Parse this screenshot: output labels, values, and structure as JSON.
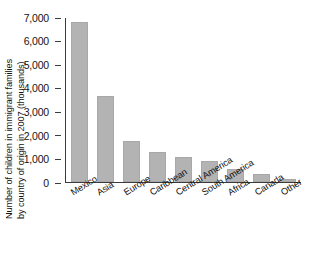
{
  "chart_data": {
    "type": "bar",
    "title": "",
    "subtitle": "",
    "xlabel": "",
    "ylabel": "Number of children in immigrant families by country of origin in 2007 (thousands)",
    "ylabel_lines": [
      "Number of children in immigrant families",
      "by country of origin in 2007 (thousands)"
    ],
    "categories": [
      "Mexico",
      "Asia",
      "Europe",
      "Caribbean",
      "Central America",
      "South America",
      "Africa",
      "Canada",
      "Other"
    ],
    "values": [
      6800,
      3670,
      1750,
      1270,
      1080,
      910,
      560,
      360,
      140
    ],
    "ylim": [
      0,
      7000
    ],
    "ytick_labels": [
      "7,000",
      "6,000",
      "5,000",
      "4,000",
      "3,000",
      "2,000",
      "1,000",
      "0"
    ],
    "ytick_values": [
      7000,
      6000,
      5000,
      4000,
      3000,
      2000,
      1000,
      0
    ],
    "grid": false,
    "legend": null,
    "legend_position": "none",
    "annotations": [],
    "colors": {
      "bar_fill": "#b3b3b3",
      "bar_edge": "#a8a8a8",
      "axis": "#3b3b3b",
      "text": "#141414",
      "background": "#ffffff"
    }
  }
}
